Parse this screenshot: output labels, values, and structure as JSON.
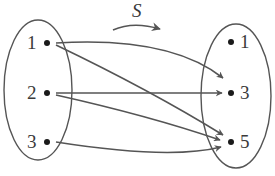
{
  "diagram": {
    "mapping_label": "S",
    "domain_set": {
      "elements": [
        {
          "label": "1"
        },
        {
          "label": "2"
        },
        {
          "label": "3"
        }
      ]
    },
    "codomain_set": {
      "elements": [
        {
          "label": "1"
        },
        {
          "label": "3"
        },
        {
          "label": "5"
        }
      ]
    },
    "relations": [
      {
        "from": "1",
        "to": "3"
      },
      {
        "from": "1",
        "to": "5"
      },
      {
        "from": "2",
        "to": "3"
      },
      {
        "from": "2",
        "to": "5"
      },
      {
        "from": "3",
        "to": "5"
      }
    ],
    "colors": {
      "stroke": "#555555",
      "dot": "#1a1a1a",
      "text": "#3a3a3a",
      "background": "#ffffff"
    }
  }
}
